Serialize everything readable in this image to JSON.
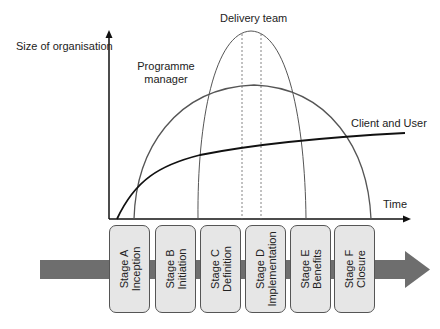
{
  "diagram": {
    "y_axis_label": "Size of organisation",
    "x_axis_label": "Time",
    "curves": [
      {
        "name": "Delivery team",
        "label": "Delivery team"
      },
      {
        "name": "Programme manager",
        "label_line1": "Programme",
        "label_line2": "manager"
      },
      {
        "name": "Client and User",
        "label": "Client and User"
      }
    ],
    "stages": [
      {
        "line1": "Stage A",
        "line2": "Inception"
      },
      {
        "line1": "Stage B",
        "line2": "Initiation"
      },
      {
        "line1": "Stage C",
        "line2": "Definition"
      },
      {
        "line1": "Stage D",
        "line2": "Implementation"
      },
      {
        "line1": "Stage E",
        "line2": "Benefits"
      },
      {
        "line1": "Stage F",
        "line2": "Closure"
      }
    ],
    "colors": {
      "arrow": "#6e6e6e",
      "box_fill": "#e6e6e6",
      "box_border": "#555555",
      "curve": "#555555",
      "axis": "#111111"
    }
  }
}
